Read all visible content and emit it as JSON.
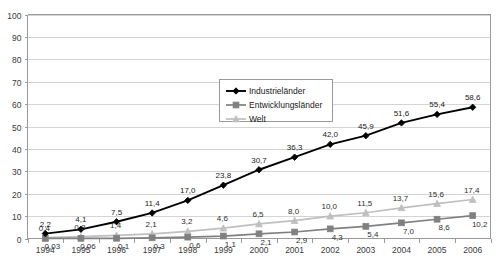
{
  "chart_data": {
    "type": "line",
    "title": "",
    "xlabel": "",
    "ylabel": "",
    "ylim": [
      0,
      100
    ],
    "ytick_labels": [
      "0",
      "10",
      "20",
      "30",
      "40",
      "50",
      "60",
      "70",
      "80",
      "90",
      "100"
    ],
    "yticks": [
      0,
      10,
      20,
      30,
      40,
      50,
      60,
      70,
      80,
      90,
      100
    ],
    "grid": true,
    "legend_position": "center",
    "categories": [
      "1994",
      "1995",
      "1996",
      "1997",
      "1998",
      "1999",
      "2000",
      "2001",
      "2002",
      "2003",
      "2004",
      "2005",
      "2006"
    ],
    "series": [
      {
        "name": "Industrieländer",
        "color": "#000000",
        "marker": "diamond",
        "values": [
          2.2,
          4.1,
          7.5,
          11.4,
          17.0,
          23.8,
          30.7,
          36.3,
          42.0,
          45.9,
          51.6,
          55.4,
          58.6
        ],
        "labels": [
          "2,2",
          "4,1",
          "7,5",
          "11,4",
          "17,0",
          "23,8",
          "30,7",
          "36,3",
          "42,0",
          "45,9",
          "51,6",
          "55,4",
          "58,6"
        ]
      },
      {
        "name": "Entwicklungsländer",
        "color": "#808080",
        "marker": "square",
        "values": [
          0.03,
          0.06,
          0.1,
          0.3,
          0.6,
          1.1,
          2.1,
          2.9,
          4.3,
          5.4,
          7.0,
          8.6,
          10.2
        ],
        "labels": [
          "0,03",
          "0,06",
          "0,1",
          "0,3",
          "0,6",
          "1,1",
          "2,1",
          "2,9",
          "4,3",
          "5,4",
          "7,0",
          "8,6",
          "10,2"
        ]
      },
      {
        "name": "Welt",
        "color": "#bfbfbf",
        "marker": "triangle",
        "values": [
          0.4,
          0.8,
          1.4,
          2.1,
          3.2,
          4.6,
          6.5,
          8.0,
          10.0,
          11.5,
          13.7,
          15.6,
          17.4
        ],
        "labels": [
          "0,4",
          "0,8",
          "1,4",
          "2,1",
          "3,2",
          "4,6",
          "6,5",
          "8,0",
          "10,0",
          "11,5",
          "13,7",
          "15,6",
          "17,4"
        ]
      }
    ]
  },
  "legend": {
    "items": [
      {
        "label": "Industrieländer"
      },
      {
        "label": "Entwicklungsländer"
      },
      {
        "label": "Welt"
      }
    ]
  },
  "colors": {
    "series_industrielaender": "#000000",
    "series_entwicklungslaender": "#808080",
    "series_welt": "#bfbfbf",
    "grid": "#d4d4d4",
    "axis": "#9a9a9a",
    "background": "#ffffff"
  }
}
